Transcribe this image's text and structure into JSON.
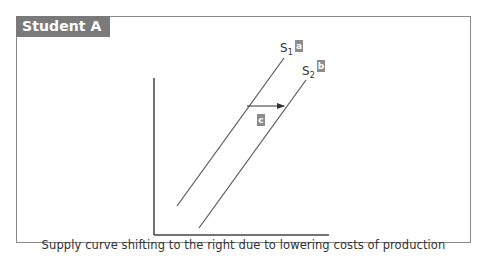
{
  "panel": {
    "title": "Student A",
    "caption": "Supply curve shifting to the right due to lowering costs of production"
  },
  "curves": [
    {
      "id": "s1",
      "name": "S",
      "subscript": "1",
      "tag": "a"
    },
    {
      "id": "s2",
      "name": "S",
      "subscript": "2",
      "tag": "b"
    }
  ],
  "shift_arrow": {
    "tag": "c",
    "direction": "right"
  },
  "colors": {
    "tab_background": "#7a7a7a",
    "border": "#8a8a8a",
    "line": "#555555",
    "tag_background": "#8c8c8c"
  }
}
